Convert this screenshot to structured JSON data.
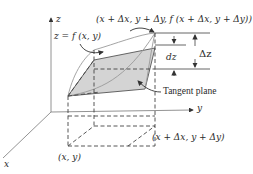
{
  "diagram": {
    "type": "3d-surface-tangent-plane",
    "axes": {
      "z_label": "z",
      "y_label": "y",
      "x_label": "x"
    },
    "labels": {
      "surface": "z = f (x, y)",
      "top_point": "(x + Δx, y + Δy, f (x + Δx, y + Δy))",
      "dz": "dz",
      "delta_z": "Δz",
      "tangent_plane": "Tangent plane",
      "base_point": "(x, y)",
      "offset_point": "(x + Δx, y + Δy)"
    },
    "colors": {
      "line": "#555555",
      "plane_fill": "#d4d4d4",
      "surface_line": "#9a9a9a",
      "text": "#2a2a2a"
    }
  }
}
